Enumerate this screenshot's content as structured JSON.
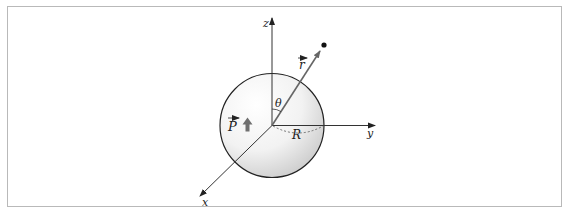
{
  "figure": {
    "labels": {
      "z_axis": "z",
      "y_axis": "y",
      "x_axis": "x",
      "position_vector": "r",
      "angle": "θ",
      "radius": "R",
      "polarization": "P"
    },
    "colors": {
      "frame_border": "#b9b9b9",
      "axis": "#333333",
      "sphere_outline": "#222222",
      "sphere_fill_light": "#ffffff",
      "sphere_fill_dark": "#cfcfcf",
      "vector_r": "#666666",
      "polarization_arrow": "#707070",
      "dashed_radius": "#555555",
      "point": "#111111"
    }
  }
}
